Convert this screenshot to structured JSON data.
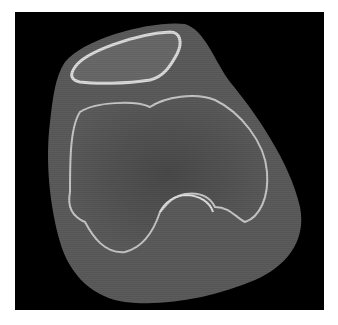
{
  "image": {
    "kind": "CT axial slice",
    "subject": "knee (patella and distal femur condyles)",
    "colors": {
      "background": "#ffffff",
      "frame": "#000000",
      "soft_tissue": "#5a5a5a",
      "bone_cortex": "#d8d8d8",
      "bone_marrow": "#4a4a4a"
    }
  }
}
